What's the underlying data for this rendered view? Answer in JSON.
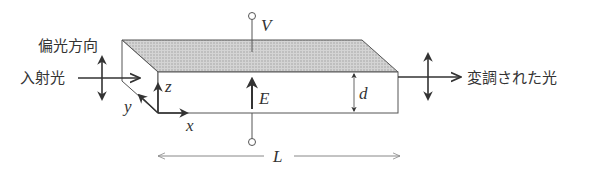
{
  "labels": {
    "polarization_direction": "偏光方向",
    "incident_light": "入射光",
    "modulated_light": "変調された光",
    "voltage": "V",
    "field": "E",
    "thickness": "d",
    "length": "L",
    "axis_x": "x",
    "axis_y": "y",
    "axis_z": "z"
  },
  "colors": {
    "stroke": "#444444",
    "electrode_fill": "#c8c8c8",
    "text": "#333333"
  }
}
